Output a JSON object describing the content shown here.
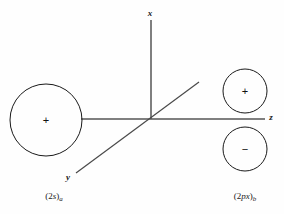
{
  "figure": {
    "background_color": "#fefefe",
    "stroke_color": "#1a1a1a",
    "axis_color": "#555555",
    "width": 284,
    "height": 214
  },
  "axes": {
    "x": {
      "label": "x",
      "x": 150,
      "y": 13,
      "line": {
        "x1": 151,
        "y1": 20,
        "x2": 151,
        "y2": 119
      }
    },
    "y": {
      "label": "y",
      "x": 68,
      "y": 177,
      "line": {
        "x1": 76,
        "y1": 173,
        "x2": 199,
        "y2": 82
      }
    },
    "z": {
      "label": "z",
      "x": 271,
      "y": 117,
      "line": {
        "x1": 81,
        "y1": 119,
        "x2": 265,
        "y2": 119
      }
    },
    "origin": {
      "x": 151,
      "y": 119
    }
  },
  "orbitals": [
    {
      "name": "two-s-orbital-a",
      "caption_prefix": "(2",
      "caption_symbol": "s",
      "caption_suffix": ")",
      "caption_subscript": "a",
      "caption_full": "(2s)a",
      "lobes": [
        {
          "sign": "+",
          "cx": 46,
          "cy": 120,
          "r": 36
        }
      ],
      "caption_x": 54,
      "caption_y": 197
    },
    {
      "name": "two-px-orbital-b",
      "caption_prefix": "(2",
      "caption_symbol": "px",
      "caption_suffix": ")",
      "caption_subscript": "b",
      "caption_full": "(2px)b",
      "lobes": [
        {
          "sign": "+",
          "cx": 245,
          "cy": 91,
          "r": 22
        },
        {
          "sign": "−",
          "cx": 245,
          "cy": 149,
          "r": 22
        }
      ],
      "caption_x": 245,
      "caption_y": 197
    }
  ],
  "signs": [
    {
      "name": "sign-plus-2s-a",
      "glyph": "+",
      "x": 46,
      "y": 120
    },
    {
      "name": "sign-plus-2px-b",
      "glyph": "+",
      "x": 245,
      "y": 91
    },
    {
      "name": "sign-minus-2px-b",
      "glyph": "−",
      "x": 245,
      "y": 149
    }
  ]
}
